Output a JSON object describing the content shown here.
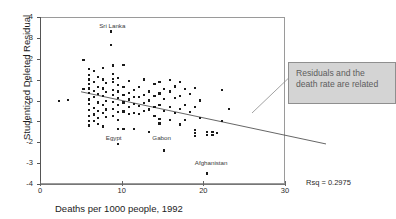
{
  "figure": {
    "top_cut_text": "",
    "rsq_label": "Rsq = 0.2975",
    "callout_text": "Residuals and the death rate are related"
  },
  "chart_data": {
    "type": "scatter",
    "title": "",
    "xlabel": "Deaths per 1000 people, 1992",
    "ylabel": "Studentized Deleted Residual",
    "xlim": [
      0,
      30
    ],
    "ylim": [
      -4,
      4
    ],
    "xticks": [
      0,
      10,
      20,
      30
    ],
    "yticks": [
      -4,
      -3,
      -2,
      -1,
      0,
      1,
      2,
      3,
      4
    ],
    "grid": false,
    "legend": null,
    "rsq": 0.2975,
    "trendline": {
      "type": "linear",
      "x_start": 0,
      "y_start": 1.28,
      "x_end": 30,
      "y_end": -1.22
    },
    "annotations": [
      {
        "text": "Sri Lanka",
        "x": 8.6,
        "y": 3.55
      },
      {
        "text": "Egypt",
        "x": 9.4,
        "y": -1.78
      },
      {
        "text": "Gabon",
        "x": 15.1,
        "y": -1.82
      },
      {
        "text": "Afghanistan",
        "x": 20.3,
        "y": -3.0
      }
    ],
    "points": [
      [
        2.2,
        0.02
      ],
      [
        3.3,
        0.06
      ],
      [
        5.9,
        1.55
      ],
      [
        5.9,
        1.25
      ],
      [
        5.9,
        1.05
      ],
      [
        5.9,
        0.85
      ],
      [
        5.9,
        0.62
      ],
      [
        5.9,
        0.4
      ],
      [
        5.9,
        0.1
      ],
      [
        5.9,
        -0.12
      ],
      [
        5.9,
        -0.42
      ],
      [
        5.9,
        -0.68
      ],
      [
        5.9,
        -0.95
      ],
      [
        5.9,
        -1.15
      ],
      [
        5.2,
        1.98
      ],
      [
        5.2,
        0.58
      ],
      [
        6.5,
        1.45
      ],
      [
        6.5,
        0.95
      ],
      [
        6.5,
        0.52
      ],
      [
        6.5,
        0.22
      ],
      [
        6.5,
        -0.3
      ],
      [
        6.5,
        -0.62
      ],
      [
        6.5,
        -0.92
      ],
      [
        7.0,
        1.18
      ],
      [
        7.0,
        0.7
      ],
      [
        7.0,
        0.36
      ],
      [
        7.0,
        -0.05
      ],
      [
        7.0,
        -0.45
      ],
      [
        7.0,
        -0.8
      ],
      [
        7.0,
        -1.08
      ],
      [
        7.6,
        1.6
      ],
      [
        7.6,
        1.05
      ],
      [
        7.6,
        0.62
      ],
      [
        7.6,
        0.25
      ],
      [
        7.6,
        -0.18
      ],
      [
        7.6,
        -0.55
      ],
      [
        7.6,
        -1.2
      ],
      [
        8.0,
        0.88
      ],
      [
        8.0,
        0.45
      ],
      [
        8.0,
        0.02
      ],
      [
        8.0,
        -0.38
      ],
      [
        8.0,
        -0.75
      ],
      [
        8.6,
        3.35
      ],
      [
        8.6,
        2.7
      ],
      [
        8.8,
        1.72
      ],
      [
        8.8,
        1.3
      ],
      [
        8.8,
        1.08
      ],
      [
        8.8,
        0.92
      ],
      [
        8.8,
        0.55
      ],
      [
        8.8,
        0.3
      ],
      [
        8.8,
        -0.02
      ],
      [
        8.8,
        -0.35
      ],
      [
        8.8,
        -0.7
      ],
      [
        9.4,
        1.12
      ],
      [
        9.4,
        0.8
      ],
      [
        9.4,
        0.48
      ],
      [
        9.4,
        0.18
      ],
      [
        9.4,
        -0.15
      ],
      [
        9.4,
        -0.52
      ],
      [
        9.4,
        -0.88
      ],
      [
        9.4,
        -1.32
      ],
      [
        9.4,
        -2.05
      ],
      [
        10.1,
        1.75
      ],
      [
        10.1,
        0.68
      ],
      [
        10.1,
        0.3
      ],
      [
        10.1,
        -0.05
      ],
      [
        10.1,
        -0.48
      ],
      [
        10.1,
        -1.3
      ],
      [
        10.8,
        1.0
      ],
      [
        10.8,
        0.42
      ],
      [
        10.8,
        0.1
      ],
      [
        10.8,
        -0.25
      ],
      [
        10.8,
        -0.6
      ],
      [
        11.4,
        0.55
      ],
      [
        11.4,
        0.2
      ],
      [
        11.4,
        -0.12
      ],
      [
        11.4,
        -0.55
      ],
      [
        11.4,
        -1.3
      ],
      [
        12.0,
        0.7
      ],
      [
        12.0,
        0.22
      ],
      [
        12.0,
        -0.2
      ],
      [
        12.0,
        -0.58
      ],
      [
        12.6,
        1.05
      ],
      [
        12.6,
        0.3
      ],
      [
        12.6,
        -0.08
      ],
      [
        12.6,
        -0.45
      ],
      [
        13.2,
        0.48
      ],
      [
        13.2,
        0.05
      ],
      [
        13.2,
        -0.38
      ],
      [
        13.2,
        -1.48
      ],
      [
        13.9,
        0.82
      ],
      [
        13.9,
        0.25
      ],
      [
        13.9,
        -0.25
      ],
      [
        13.9,
        -0.7
      ],
      [
        14.5,
        0.95
      ],
      [
        14.5,
        0.38
      ],
      [
        14.5,
        -0.15
      ],
      [
        14.5,
        -0.82
      ],
      [
        14.5,
        -1.05
      ],
      [
        15.1,
        0.6
      ],
      [
        15.1,
        0.12
      ],
      [
        15.1,
        -0.45
      ],
      [
        15.1,
        -2.35
      ],
      [
        15.8,
        1.02
      ],
      [
        15.8,
        0.48
      ],
      [
        15.8,
        -0.28
      ],
      [
        15.8,
        -0.9
      ],
      [
        16.4,
        0.72
      ],
      [
        16.4,
        0.18
      ],
      [
        16.4,
        -0.55
      ],
      [
        17.0,
        0.92
      ],
      [
        17.0,
        0.25
      ],
      [
        17.0,
        -0.35
      ],
      [
        17.0,
        -1.1
      ],
      [
        17.6,
        0.58
      ],
      [
        17.6,
        -0.18
      ],
      [
        17.6,
        -0.88
      ],
      [
        18.2,
        0.35
      ],
      [
        18.2,
        -0.52
      ],
      [
        18.9,
        0.65
      ],
      [
        18.9,
        -0.25
      ],
      [
        18.9,
        -1.38
      ],
      [
        18.9,
        -1.52
      ],
      [
        18.9,
        -1.65
      ],
      [
        19.5,
        0.05
      ],
      [
        19.5,
        -0.78
      ],
      [
        20.3,
        -1.45
      ],
      [
        20.3,
        -1.62
      ],
      [
        20.3,
        -3.45
      ],
      [
        21.0,
        -1.48
      ],
      [
        21.0,
        -1.62
      ],
      [
        21.6,
        -1.5
      ],
      [
        22.2,
        0.55
      ],
      [
        22.2,
        -0.95
      ],
      [
        23.0,
        -0.35
      ]
    ]
  }
}
